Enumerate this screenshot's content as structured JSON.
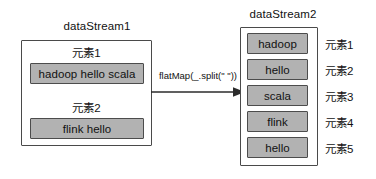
{
  "diagram": {
    "title_left": "dataStream1",
    "title_right": "dataStream2",
    "transform_label": "flatMap(_.split(\" \"))",
    "colors": {
      "chip_fill": "#b2b2b2",
      "chip_border": "#4c4c4c",
      "box_border": "#4a4a4a",
      "background": "#ffffff",
      "text": "#111111"
    }
  },
  "source_stream": {
    "name": "dataStream1",
    "elements": [
      {
        "heading": "元素1",
        "value": "hadoop hello scala"
      },
      {
        "heading": "元素2",
        "value": "flink hello"
      }
    ]
  },
  "target_stream": {
    "name": "dataStream2",
    "elements": [
      {
        "value": "hadoop",
        "label": "元素1"
      },
      {
        "value": "hello",
        "label": "元素2"
      },
      {
        "value": "scala",
        "label": "元素3"
      },
      {
        "value": "flink",
        "label": "元素4"
      },
      {
        "value": "hello",
        "label": "元素5"
      }
    ]
  }
}
